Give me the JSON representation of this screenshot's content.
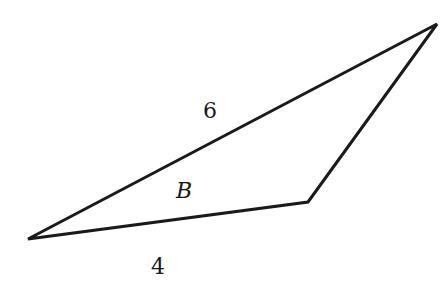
{
  "diagram": {
    "type": "triangle",
    "stroke_color": "#1a1a1a",
    "background": "#ffffff",
    "vertices": {
      "left": {
        "x": 28,
        "y": 239
      },
      "top_right": {
        "x": 437,
        "y": 24
      },
      "bottom_right": {
        "x": 308,
        "y": 202
      }
    },
    "edges": [
      {
        "from": "left",
        "to": "top_right",
        "label": "6"
      },
      {
        "from": "left",
        "to": "bottom_right",
        "label": "4"
      },
      {
        "from": "bottom_right",
        "to": "top_right",
        "label": ""
      }
    ],
    "labels": {
      "side_long": "6",
      "side_bottom": "4",
      "angle": "B"
    }
  }
}
